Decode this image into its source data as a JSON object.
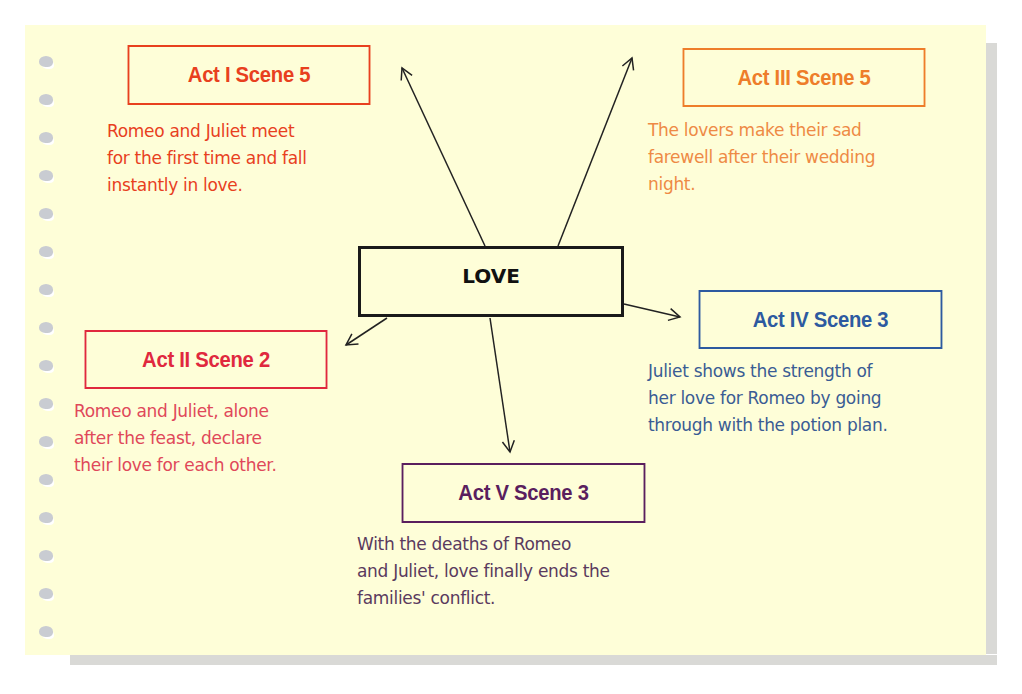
{
  "diagram": {
    "center": {
      "label": "LOVE",
      "color": "#111111"
    },
    "nodes": [
      {
        "id": "act1-scene5",
        "title": "Act I Scene 5",
        "color": "#e8401e",
        "text_lines": [
          "Romeo and Juliet meet",
          "for the first time and fall",
          "instantly in love."
        ]
      },
      {
        "id": "act3-scene5",
        "title": "Act III Scene 5",
        "color": "#ee7d2a",
        "text_lines": [
          "The lovers make their sad",
          "farewell after their wedding",
          "night."
        ]
      },
      {
        "id": "act2-scene2",
        "title": "Act II Scene 2",
        "color": "#e0283e",
        "text_lines": [
          "Romeo and Juliet, alone",
          "after the feast, declare",
          "their love for each other."
        ]
      },
      {
        "id": "act4-scene3",
        "title": "Act IV Scene 3",
        "color": "#2d5aa0",
        "text_lines": [
          "Juliet shows the strength of",
          "her love for Romeo by going",
          "through with the potion plan."
        ]
      },
      {
        "id": "act5-scene3",
        "title": "Act V Scene 3",
        "color": "#5a1e5e",
        "text_lines": [
          "With the deaths of Romeo",
          "and Juliet, love finally ends the",
          "families' conflict."
        ]
      }
    ],
    "edges": [
      {
        "from": "LOVE",
        "to": "act1-scene5"
      },
      {
        "from": "LOVE",
        "to": "act3-scene5"
      },
      {
        "from": "LOVE",
        "to": "act2-scene2"
      },
      {
        "from": "LOVE",
        "to": "act4-scene3"
      },
      {
        "from": "LOVE",
        "to": "act5-scene3"
      }
    ],
    "paper_color": "#fefed8"
  }
}
